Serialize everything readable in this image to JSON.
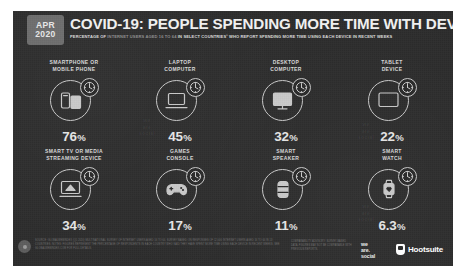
{
  "header": {
    "badge_month": "APR",
    "badge_year": "2020",
    "title": "COVID-19: PEOPLE SPENDING MORE TIME WITH DEVICES",
    "subtitle_parts": [
      {
        "text": "PERCENTAGE OF ",
        "emphasis": true
      },
      {
        "text": "INTERNET USERS AGED 16 TO 64 ",
        "emphasis": false
      },
      {
        "text": "IN SELECT COUNTRIES",
        "emphasis": true
      },
      {
        "text": "¹ ",
        "emphasis": true
      },
      {
        "text": "WHO REPORT SPENDING MORE TIME USING EACH DEVICE IN RECENT WEEKS",
        "emphasis": true
      }
    ]
  },
  "chart_data": {
    "type": "bar",
    "title": "COVID-19: PEOPLE SPENDING MORE TIME WITH DEVICES",
    "subtitle": "PERCENTAGE OF INTERNET USERS AGED 16 TO 64 IN SELECT COUNTRIES¹ WHO REPORT SPENDING MORE TIME USING EACH DEVICE IN RECENT WEEKS",
    "categories": [
      "SMARTPHONE OR MOBILE PHONE",
      "LAPTOP COMPUTER",
      "DESKTOP COMPUTER",
      "TABLET DEVICE",
      "SMART TV OR MEDIA STREAMING DEVICE",
      "GAMES CONSOLE",
      "SMART SPEAKER",
      "SMART WATCH"
    ],
    "values": [
      76,
      45,
      32,
      22,
      34,
      17,
      11,
      6.3
    ],
    "value_labels": [
      "76%",
      "45%",
      "32%",
      "22%",
      "34%",
      "17%",
      "11%",
      "6.3%"
    ],
    "xlabel": "",
    "ylabel": "Percentage of internet users",
    "ylim": [
      0,
      100
    ],
    "grid": false,
    "legend": "none"
  },
  "devices": [
    {
      "label_lines": [
        "SMARTPHONE OR",
        "MOBILE PHONE"
      ],
      "value_number": "76",
      "value_pct": "%",
      "icon": "smartphone-icon",
      "badge_icon": "clock-icon"
    },
    {
      "label_lines": [
        "LAPTOP",
        "COMPUTER"
      ],
      "value_number": "45",
      "value_pct": "%",
      "icon": "laptop-icon",
      "badge_icon": "clock-icon"
    },
    {
      "label_lines": [
        "DESKTOP",
        "COMPUTER"
      ],
      "value_number": "32",
      "value_pct": "%",
      "icon": "desktop-icon",
      "badge_icon": "clock-icon"
    },
    {
      "label_lines": [
        "TABLET",
        "DEVICE"
      ],
      "value_number": "22",
      "value_pct": "%",
      "icon": "tablet-icon",
      "badge_icon": "clock-icon"
    },
    {
      "label_lines": [
        "SMART TV OR MEDIA",
        "STREAMING DEVICE"
      ],
      "value_number": "34",
      "value_pct": "%",
      "icon": "smart-tv-icon",
      "badge_icon": "clock-icon"
    },
    {
      "label_lines": [
        "GAMES",
        "CONSOLE"
      ],
      "value_number": "17",
      "value_pct": "%",
      "icon": "games-console-icon",
      "badge_icon": "clock-icon"
    },
    {
      "label_lines": [
        "SMART",
        "SPEAKER"
      ],
      "value_number": "11",
      "value_pct": "%",
      "icon": "smart-speaker-icon",
      "badge_icon": "clock-icon"
    },
    {
      "label_lines": [
        "SMART",
        "WATCH"
      ],
      "value_number": "6.3",
      "value_pct": "%",
      "icon": "smart-watch-icon",
      "badge_icon": "clock-icon"
    }
  ],
  "footer": {
    "source_note": "SOURCE: GLOBALWEBINDEX (Q1 2020) MULTINATIONAL SURVEY OF INTERNET USERS AGED 16 TO 64. SURVEY BASED ON RESPONSES OF 12,000 INTERNET USERS AGED 16 TO 64 IN 13 COUNTRIES. NOTES: FIGURES REPRESENT THE PERCENTAGE OF RESPONDENTS IN EACH COUNTRY WHO SAID THEY HAVE SPENT MORE TIME USING EACH DEVICE IN RECENT WEEKS. SEE GLOBALWEBINDEX.COM FOR FULL DETAILS.",
    "comparability_note": "COMPARABILITY ADVISORY: SURVEY-BASED DATA. FIGURES MAY NOT BE COMPARABLE WITH PREVIOUS REPORTS.",
    "logo_we": "we",
    "logo_are": "are.",
    "logo_social": "social",
    "logo_hootsuite": "Hootsuite"
  },
  "colors": {
    "slide_bg": "#2b2b2b",
    "badge_bg": "#6e6e6e",
    "title_text": "#f2f2f2",
    "value_text": "#e6e6e6",
    "icon_stroke": "#c9c9c9",
    "muted_text": "#6f6f6f"
  }
}
